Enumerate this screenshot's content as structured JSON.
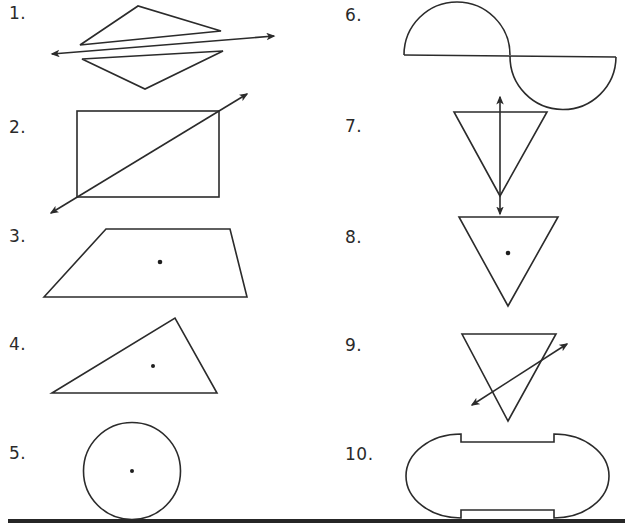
{
  "worksheet": {
    "problems": [
      {
        "number": "1.",
        "figure": "two triangles with a line passing between them"
      },
      {
        "number": "2.",
        "figure": "rectangle with a diagonal line"
      },
      {
        "number": "3.",
        "figure": "trapezoid with center point"
      },
      {
        "number": "4.",
        "figure": "scalene triangle with center point"
      },
      {
        "number": "5.",
        "figure": "circle with center point"
      },
      {
        "number": "6.",
        "figure": "two semicircles on a line"
      },
      {
        "number": "7.",
        "figure": "inverted triangle with vertical line"
      },
      {
        "number": "8.",
        "figure": "inverted triangle with center point"
      },
      {
        "number": "9.",
        "figure": "inverted triangle with oblique line"
      },
      {
        "number": "10.",
        "figure": "rounded shape with notched edges"
      }
    ],
    "colors": {
      "ink": "#2b2b2b",
      "background": "#ffffff"
    }
  }
}
